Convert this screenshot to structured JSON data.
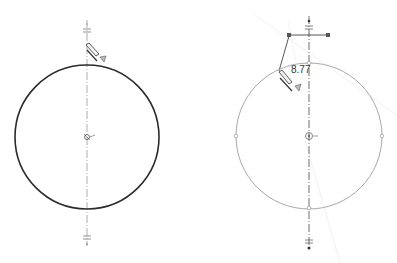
{
  "view": {
    "type": "cad-sketch-comparison",
    "background": "#ffffff"
  },
  "left_panel": {
    "name": "circle-sketch-before",
    "circle": {
      "cx": 87,
      "cy": 137,
      "r": 72,
      "stroke": "#2b2b2b",
      "stroke_width": 1.6
    },
    "centerline": {
      "x": 87,
      "y1": 20,
      "y2": 246,
      "stroke": "#9a9a9a"
    },
    "symmetry_marks": [
      {
        "x": 87,
        "y": 31
      },
      {
        "x": 87,
        "y": 238
      }
    ],
    "icons": [
      "pencil-cursor-icon",
      "center-point-icon"
    ]
  },
  "right_panel": {
    "name": "circle-sketch-selected",
    "circle": {
      "cx": 309,
      "cy": 136,
      "r": 73,
      "stroke": "#a8a8a8",
      "stroke_width": 1
    },
    "centerline": {
      "x": 309,
      "y1": 16,
      "y2": 250,
      "stroke": "#4a4a4a"
    },
    "dimension": {
      "value": "8.77",
      "x": 290,
      "y": 64
    },
    "handle_bar": {
      "x1": 289,
      "x2": 328,
      "y": 35
    },
    "quadrant_points": [
      {
        "x": 236,
        "y": 136
      },
      {
        "x": 382,
        "y": 136
      },
      {
        "x": 309,
        "y": 63
      },
      {
        "x": 309,
        "y": 208
      }
    ],
    "symmetry_marks": [
      {
        "x": 309,
        "y": 27
      },
      {
        "x": 309,
        "y": 243
      }
    ],
    "icons": [
      "pencil-cursor-icon",
      "center-point-icon",
      "drag-handle-icon"
    ]
  },
  "colors": {
    "sketch_dark": "#2b2b2b",
    "sketch_light": "#a8a8a8",
    "construction": "#e6e6e6",
    "handle": "#555555"
  }
}
